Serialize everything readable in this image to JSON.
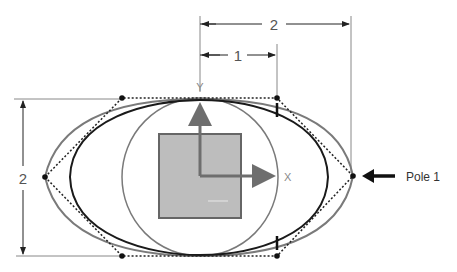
{
  "dimensions": {
    "top_outer": "2",
    "top_inner": "1",
    "left_height": "2"
  },
  "axes": {
    "x_label": "X",
    "y_label": "Y"
  },
  "callout": {
    "label": "Pole 1"
  },
  "colors": {
    "curve_dark": "#1a1a1a",
    "curve_gray": "#7a7a7a",
    "square_fill": "#bdbdbd",
    "square_stroke": "#666666",
    "axis": "#6e6e6e",
    "dim_line": "#888888"
  }
}
